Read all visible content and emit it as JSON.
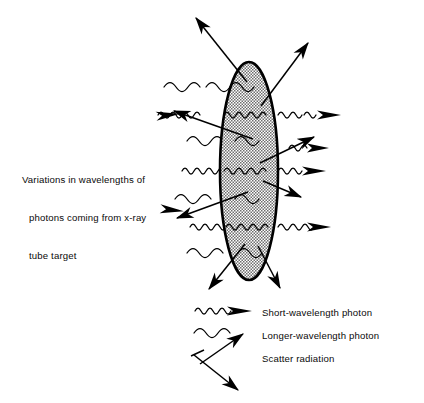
{
  "figure": {
    "title_text": {
      "line1": "Variations in wavelengths of",
      "line2": "photons coming from x-ray",
      "line3": "tube target"
    },
    "body": {
      "name": "patient-body-cross-section",
      "shape": "ellipse",
      "fill": "#d8d8d8",
      "stroke": "#000000",
      "cx": 249,
      "cy": 171,
      "rx": 29,
      "ry": 109
    },
    "colors": {
      "ink": "#000000",
      "text": "#0a0a0a",
      "background": "#ffffff",
      "body_fill": "#d8d8d8"
    },
    "legend": {
      "items": [
        {
          "key": "short",
          "label": "Short-wavelength photon",
          "symbol": "short-wavelength-photon-symbol"
        },
        {
          "key": "long",
          "label": "Longer-wavelength photon",
          "symbol": "longer-wavelength-photon-symbol"
        },
        {
          "key": "scatter",
          "label": "Scatter radiation",
          "symbol": "scatter-radiation-symbol"
        }
      ]
    }
  }
}
